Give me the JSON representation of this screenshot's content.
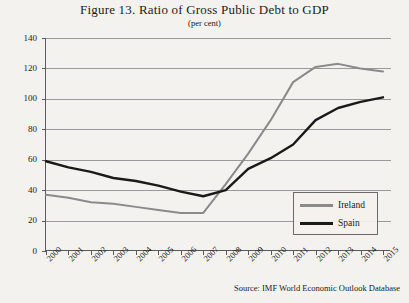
{
  "chart_data": {
    "type": "line",
    "title": "Figure 13. Ratio of Gross Public Debt to GDP",
    "subtitle": "(per cent)",
    "xlabel": "",
    "ylabel": "",
    "ylim": [
      0,
      140
    ],
    "ytick_step": 20,
    "yticks": [
      "0",
      "20",
      "40",
      "60",
      "80",
      "100",
      "120",
      "140"
    ],
    "grid": true,
    "legend_position": "bottom-right",
    "categories": [
      "2000",
      "2001",
      "2002",
      "2003",
      "2004",
      "2005",
      "2006",
      "2007",
      "2008",
      "2009",
      "2010",
      "2011",
      "2012",
      "2013",
      "2014",
      "2015"
    ],
    "series": [
      {
        "name": "Ireland",
        "color": "#8a8a8a",
        "values": [
          37,
          35,
          32,
          31,
          29,
          27,
          25,
          25,
          44,
          64,
          86,
          111,
          121,
          123,
          120,
          118
        ]
      },
      {
        "name": "Spain",
        "color": "#1a1a1a",
        "values": [
          59,
          55,
          52,
          48,
          46,
          43,
          39,
          36,
          40,
          54,
          61,
          70,
          86,
          94,
          98,
          101
        ]
      }
    ],
    "source": "Source: IMF World Economic Outlook Database"
  }
}
